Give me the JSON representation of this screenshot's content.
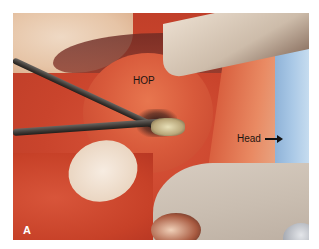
{
  "figure": {
    "panel_label": "A",
    "annotations": {
      "structure_label": "HOP",
      "orientation_label": "Head",
      "orientation_arrow": "arrow-right-icon"
    },
    "colors": {
      "border": "#ffffff",
      "tissue": "#d85a3b",
      "drape": "#a9c8e6",
      "retractor": "#c9bdb0",
      "label_text": "#1c1410",
      "panel_label_text": "#ffffff"
    }
  }
}
